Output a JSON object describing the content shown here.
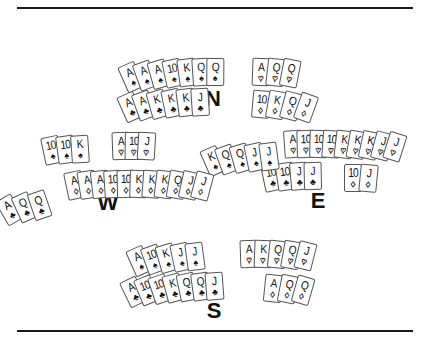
{
  "board": {
    "seats": [
      {
        "id": "N",
        "label": "N",
        "label_pos": [
          213,
          86
        ],
        "groups": [
          {
            "suit": "spades",
            "symbol": "♠",
            "color": "black",
            "cards": [
              "A",
              "A",
              "A",
              "10",
              "K",
              "Q",
              "Q"
            ],
            "center": [
              176,
              86
            ],
            "spread": 9,
            "start_angle": -24
          },
          {
            "suit": "hearts",
            "symbol": "♥",
            "color": "red",
            "cards": [
              "A",
              "Q",
              "Q"
            ],
            "center": [
              260,
              86
            ],
            "spread": 10,
            "start_angle": 2
          },
          {
            "suit": "clubs",
            "symbol": "♣",
            "color": "black",
            "cards": [
              "A",
              "A",
              "K",
              "K",
              "K",
              "J"
            ],
            "center": [
              170,
              116
            ],
            "spread": 9,
            "start_angle": -24
          },
          {
            "suit": "diamonds",
            "symbol": "♦",
            "color": "red",
            "cards": [
              "10",
              "K",
              "Q",
              "J"
            ],
            "center": [
              262,
              118
            ],
            "spread": 11,
            "start_angle": 5
          }
        ]
      },
      {
        "id": "W",
        "label": "W",
        "label_pos": [
          108,
          190
        ],
        "groups": [
          {
            "suit": "spades",
            "symbol": "♠",
            "color": "black",
            "cards": [
              "10",
              "10",
              "K"
            ],
            "center": [
              65,
              163
            ],
            "spread": 9,
            "start_angle": -12
          },
          {
            "suit": "hearts",
            "symbol": "♥",
            "color": "red",
            "cards": [
              "A",
              "10",
              "J"
            ],
            "center": [
              124,
              160
            ],
            "spread": 6,
            "start_angle": -2
          },
          {
            "suit": "clubs",
            "symbol": "♣",
            "color": "black",
            "cards": [
              "A",
              "Q",
              "Q"
            ],
            "center": [
              40,
              216
            ],
            "spread": 12,
            "start_angle": -30
          },
          {
            "suit": "diamonds",
            "symbol": "♦",
            "color": "red",
            "cards": [
              "A",
              "A",
              "A",
              "10",
              "10",
              "K",
              "K",
              "K",
              "Q",
              "J",
              "J"
            ],
            "center": [
              128,
              198
            ],
            "spread": 6,
            "start_angle": -12
          }
        ]
      },
      {
        "id": "E",
        "label": "E",
        "label_pos": [
          318,
          188
        ],
        "groups": [
          {
            "suit": "spades",
            "symbol": "♠",
            "color": "black",
            "cards": [
              "K",
              "Q",
              "Q",
              "J",
              "J"
            ],
            "center": [
              248,
              170
            ],
            "spread": 9,
            "start_angle": -24
          },
          {
            "suit": "hearts",
            "symbol": "♥",
            "color": "red",
            "cards": [
              "A",
              "10",
              "10",
              "10",
              "K",
              "K",
              "K",
              "J",
              "J"
            ],
            "center": [
              328,
              158
            ],
            "spread": 6,
            "start_angle": -4
          },
          {
            "suit": "clubs",
            "symbol": "♣",
            "color": "black",
            "cards": [
              "10",
              "10",
              "J",
              "J"
            ],
            "center": [
              290,
              190
            ],
            "spread": 8,
            "start_angle": -12
          },
          {
            "suit": "diamonds",
            "symbol": "♦",
            "color": "red",
            "cards": [
              "10",
              "J"
            ],
            "center": [
              349,
              192
            ],
            "spread": 12,
            "start_angle": 0
          }
        ]
      },
      {
        "id": "S",
        "label": "S",
        "label_pos": [
          214,
          298
        ],
        "groups": [
          {
            "suit": "spades",
            "symbol": "♠",
            "color": "black",
            "cards": [
              "A",
              "10",
              "K",
              "J",
              "J"
            ],
            "center": [
              174,
              270
            ],
            "spread": 9,
            "start_angle": -24
          },
          {
            "suit": "hearts",
            "symbol": "♥",
            "color": "red",
            "cards": [
              "A",
              "K",
              "Q",
              "Q",
              "J"
            ],
            "center": [
              262,
              268
            ],
            "spread": 9,
            "start_angle": -2
          },
          {
            "suit": "clubs",
            "symbol": "♣",
            "color": "black",
            "cards": [
              "A",
              "10",
              "10",
              "K",
              "Q",
              "Q",
              "J"
            ],
            "center": [
              180,
              300
            ],
            "spread": 8,
            "start_angle": -26
          },
          {
            "suit": "diamonds",
            "symbol": "♦",
            "color": "red",
            "cards": [
              "A",
              "Q",
              "Q"
            ],
            "center": [
              268,
              302
            ],
            "spread": 11,
            "start_angle": 6
          }
        ]
      }
    ]
  }
}
